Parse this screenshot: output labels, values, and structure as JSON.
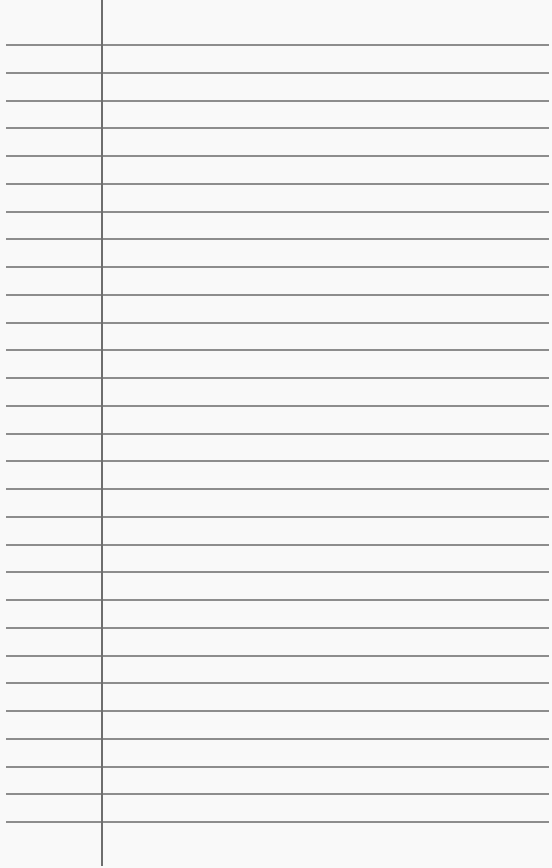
{
  "paper": {
    "type": "ruled-notebook-page",
    "rule_color": "#8d8d8d",
    "margin_color": "#6e6e6e",
    "background": "#f9f9f9",
    "rule_count": 29,
    "first_rule_y": 45,
    "rule_spacing": 27.75,
    "margin_x": 101
  }
}
